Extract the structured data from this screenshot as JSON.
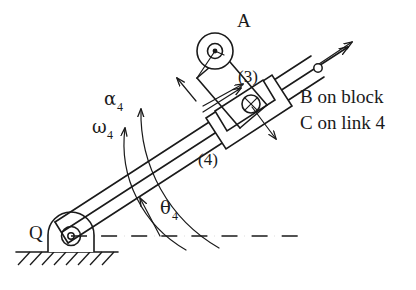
{
  "figure": {
    "kind": "kinematic-mechanism-diagram",
    "ink_color": "#1a1a1a",
    "background_color": "#ffffff"
  },
  "labels": {
    "point_a": "A",
    "point_q": "Q",
    "link3": "(3)",
    "link4": "(4)",
    "alpha4": "α",
    "alpha4_sub": "4",
    "omega4": "ω",
    "omega4_sub": "4",
    "theta4": "θ",
    "theta4_sub": "4",
    "b_on_block": "B on block",
    "c_on_link4": "C on link 4"
  },
  "annotations": {
    "ground_pivot": "ground-pivot-at-Q",
    "pin_joint_a": "pin-joint-at-A",
    "sliding_point": "coincident-points-B-C",
    "reference_line": "horizontal-datum-dash-dot",
    "hatching": "fixed-ground-hatching"
  }
}
